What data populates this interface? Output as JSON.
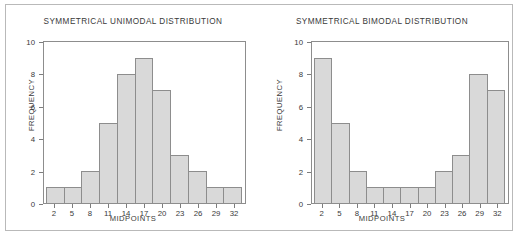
{
  "figure": {
    "background": "#ffffff",
    "border_color": "#b9b9b9",
    "bar_fill": "#d9d9d9",
    "bar_edge": "#8d8d8d",
    "axis_color": "#8d8d8d",
    "text_color": "#3a3a3a"
  },
  "charts": [
    {
      "id": "unimodal",
      "title": "SYMMETRICAL UNIMODAL DISTRIBUTION",
      "xlabel": "MIDPOINTS",
      "ylabel": "FREQUENCY",
      "yticks": [
        "0",
        "2",
        "4",
        "6",
        "8",
        "10"
      ],
      "xticks": [
        "2",
        "5",
        "8",
        "11",
        "14",
        "17",
        "20",
        "23",
        "26",
        "29",
        "32"
      ]
    },
    {
      "id": "bimodal",
      "title": "SYMMETRICAL BIMODAL DISTRIBUTION",
      "xlabel": "MIDPOINTS",
      "ylabel": "FREQUENCY",
      "yticks": [
        "0",
        "2",
        "4",
        "6",
        "8",
        "10"
      ],
      "xticks": [
        "2",
        "5",
        "8",
        "11",
        "14",
        "17",
        "20",
        "23",
        "26",
        "29",
        "32"
      ]
    }
  ],
  "chart_data": [
    {
      "type": "bar",
      "title": "SYMMETRICAL UNIMODAL DISTRIBUTION",
      "xlabel": "MIDPOINTS",
      "ylabel": "FREQUENCY",
      "categories": [
        "2",
        "5",
        "8",
        "11",
        "14",
        "17",
        "20",
        "23",
        "26",
        "29",
        "32"
      ],
      "values": [
        1,
        1,
        2,
        5,
        8,
        9,
        7,
        3,
        2,
        1,
        1
      ],
      "ylim": [
        0,
        10
      ],
      "yticks": [
        0,
        2,
        4,
        6,
        8,
        10
      ],
      "grid": false,
      "legend": "none"
    },
    {
      "type": "bar",
      "title": "SYMMETRICAL BIMODAL DISTRIBUTION",
      "xlabel": "MIDPOINTS",
      "ylabel": "FREQUENCY",
      "categories": [
        "2",
        "5",
        "8",
        "11",
        "14",
        "17",
        "20",
        "23",
        "26",
        "29",
        "32"
      ],
      "values": [
        9,
        5,
        2,
        1,
        1,
        1,
        1,
        2,
        3,
        8,
        7
      ],
      "ylim": [
        0,
        10
      ],
      "yticks": [
        0,
        2,
        4,
        6,
        8,
        10
      ],
      "grid": false,
      "legend": "none"
    }
  ]
}
